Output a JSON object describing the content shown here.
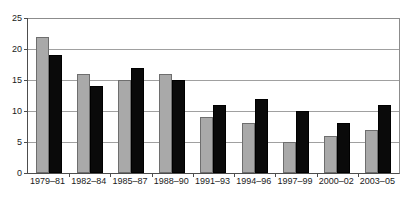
{
  "chart_data": {
    "type": "bar",
    "title": "",
    "subtitle": "",
    "xlabel": "",
    "ylabel": "",
    "ylim": [
      0,
      25
    ],
    "yticks": [
      0,
      5,
      10,
      15,
      20,
      25
    ],
    "grid": true,
    "legend": "none",
    "categories": [
      "1979–81",
      "1982–84",
      "1985–87",
      "1988–90",
      "1991–93",
      "1994–96",
      "1997–99",
      "2000–02",
      "2003–05"
    ],
    "series": [
      {
        "name": "series-a",
        "color": "#a9a9a9",
        "values": [
          22,
          16,
          15,
          16,
          9,
          8,
          5,
          6,
          7
        ]
      },
      {
        "name": "series-b",
        "color": "#0a0a0a",
        "values": [
          19,
          14,
          17,
          15,
          11,
          12,
          10,
          8,
          11
        ]
      }
    ]
  },
  "colors": {
    "series_a": "#a9a9a9",
    "series_b": "#0a0a0a",
    "axis": "#4d4d4d",
    "grid": "#a0a0a0",
    "background": "#ffffff",
    "text": "#1a1a1a"
  }
}
